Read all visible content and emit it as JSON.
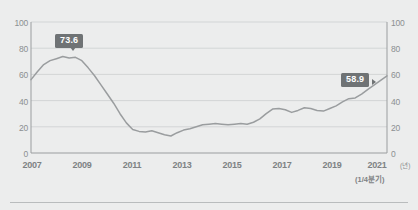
{
  "chart_data": {
    "type": "line",
    "title": "",
    "xlabel": "",
    "ylabel": "",
    "ylim": [
      0,
      100
    ],
    "ytick_values": [
      0,
      20,
      40,
      60,
      80,
      100
    ],
    "yticks_left": [
      "0",
      "20",
      "40",
      "60",
      "80",
      "100"
    ],
    "yticks_right": [
      "0",
      "20",
      "40",
      "60",
      "80",
      "100"
    ],
    "xticks": [
      "2007",
      "2009",
      "2011",
      "2013",
      "2015",
      "2017",
      "2019",
      "2021"
    ],
    "x_unit_label": "(년)",
    "x_sub_label": "(1/4분기)",
    "grid": true,
    "legend": "none",
    "line_color": "#9a9d9f",
    "background_color": "#eceded",
    "annotations": [
      {
        "label": "73.6",
        "x_value": 2008.25,
        "y_value": 73.6
      },
      {
        "label": "58.9",
        "x_value": 2021.0,
        "y_value": 58.9
      }
    ],
    "x": [
      2007.0,
      2007.25,
      2007.5,
      2007.75,
      2008.0,
      2008.25,
      2008.5,
      2008.75,
      2009.0,
      2009.25,
      2009.5,
      2009.75,
      2010.0,
      2010.25,
      2010.5,
      2010.75,
      2011.0,
      2011.25,
      2011.5,
      2011.75,
      2012.0,
      2012.25,
      2012.5,
      2012.75,
      2013.0,
      2013.25,
      2013.5,
      2013.75,
      2014.0,
      2014.25,
      2014.5,
      2014.75,
      2015.0,
      2015.25,
      2015.5,
      2015.75,
      2016.0,
      2016.25,
      2016.5,
      2016.75,
      2017.0,
      2017.25,
      2017.5,
      2017.75,
      2018.0,
      2018.25,
      2018.5,
      2018.75,
      2019.0,
      2019.25,
      2019.5,
      2019.75,
      2020.0,
      2020.25,
      2020.5,
      2020.75,
      2021.0
    ],
    "values": [
      56.0,
      62.0,
      67.5,
      70.5,
      72.0,
      73.6,
      72.5,
      73.0,
      70.5,
      65.0,
      59.0,
      52.0,
      45.0,
      38.0,
      30.0,
      23.0,
      18.0,
      16.5,
      16.0,
      17.0,
      15.5,
      14.0,
      13.0,
      15.5,
      17.5,
      18.5,
      20.0,
      21.5,
      22.0,
      22.5,
      22.0,
      21.5,
      22.0,
      22.5,
      22.0,
      23.5,
      26.0,
      30.0,
      33.5,
      34.0,
      33.0,
      31.0,
      32.5,
      34.5,
      34.0,
      32.5,
      32.0,
      34.0,
      36.0,
      39.0,
      41.5,
      42.0,
      45.0,
      48.5,
      52.0,
      55.5,
      58.9
    ]
  },
  "axes": {
    "y_left_ticks": [
      "100",
      "80",
      "60",
      "40",
      "20",
      "0"
    ],
    "y_right_ticks": [
      "100",
      "80",
      "60",
      "40",
      "20",
      "0"
    ]
  }
}
